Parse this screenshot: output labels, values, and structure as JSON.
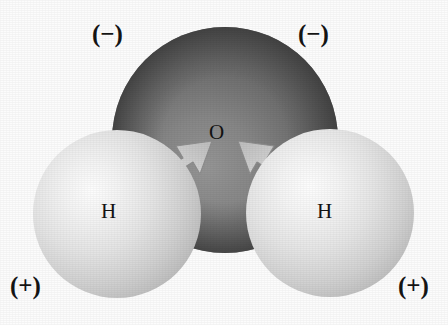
{
  "figure": {
    "background_color": "#fcfcfc"
  },
  "atoms": [
    {
      "id": "oxygen",
      "label": "O",
      "element": "O",
      "kind": "oxygen-sphere",
      "color": "#5f5f5f",
      "highlight_color": "#8e8e8e",
      "shadow_color": "#3a3a3a",
      "cx": 225,
      "cy": 140,
      "r": 113
    },
    {
      "id": "hydrogen-left",
      "label": "H",
      "element": "H",
      "kind": "hydrogen-sphere",
      "color": "#d8d8d8",
      "highlight_color": "#fbfbfb",
      "shadow_color": "#a9a9a9",
      "cx": 117,
      "cy": 214,
      "r": 84
    },
    {
      "id": "hydrogen-right",
      "label": "H",
      "element": "H",
      "kind": "hydrogen-sphere",
      "color": "#d8d8d8",
      "highlight_color": "#fbfbfb",
      "shadow_color": "#a9a9a9",
      "cx": 330,
      "cy": 213,
      "r": 84
    }
  ],
  "charges": {
    "negative_left": "(−)",
    "negative_right": "(−)",
    "positive_left": "(+)",
    "positive_right": "(+)"
  },
  "arrows": [
    {
      "id": "arrow-left",
      "meaning": "electron-density-shift-toward-oxygen",
      "from": "hydrogen-left",
      "to": "oxygen",
      "direction": "up-right",
      "color": "#cfcfcf"
    },
    {
      "id": "arrow-right",
      "meaning": "electron-density-shift-toward-oxygen",
      "from": "hydrogen-right",
      "to": "oxygen",
      "direction": "up-left",
      "color": "#cfcfcf"
    }
  ]
}
